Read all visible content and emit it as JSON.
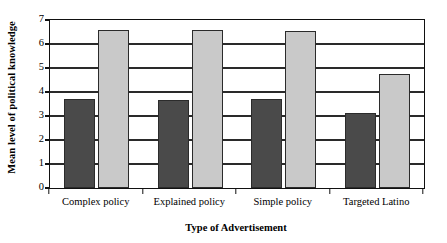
{
  "chart_data": {
    "type": "bar",
    "title": "",
    "xlabel": "Type of Advertisement",
    "ylabel": "Mean level of political knowledge",
    "categories": [
      "Complex policy",
      "Explained policy",
      "Simple policy",
      "Targeted Latino"
    ],
    "series": [
      {
        "name": "dark",
        "color": "#4a4a4a",
        "values": [
          3.7,
          3.65,
          3.7,
          3.12
        ]
      },
      {
        "name": "light",
        "color": "#c9c9c9",
        "values": [
          6.6,
          6.6,
          6.55,
          4.75
        ]
      }
    ],
    "ylim": [
      0,
      7
    ],
    "yticks": [
      0,
      1,
      2,
      3,
      4,
      5,
      6,
      7
    ],
    "ytick_labels": [
      "0",
      "1",
      "2",
      "3",
      "4",
      "5",
      "6",
      "7"
    ],
    "grid": true,
    "grid_axis": "y",
    "legend": "none",
    "bar_edge_color": "#2b2b2b",
    "axis_color": "#111111"
  }
}
